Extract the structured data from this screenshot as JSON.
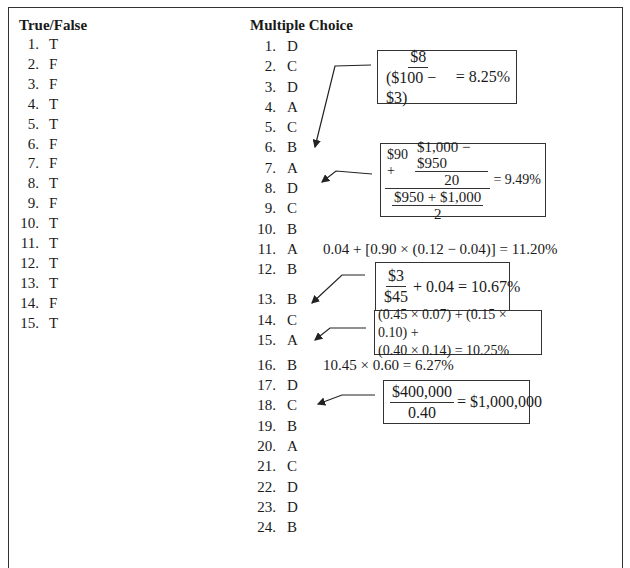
{
  "true_false": {
    "title": "True/False",
    "items": [
      {
        "num": "1.",
        "answer": "T"
      },
      {
        "num": "2.",
        "answer": "F"
      },
      {
        "num": "3.",
        "answer": "F"
      },
      {
        "num": "4.",
        "answer": "T"
      },
      {
        "num": "5.",
        "answer": "T"
      },
      {
        "num": "6.",
        "answer": "F"
      },
      {
        "num": "7.",
        "answer": "F"
      },
      {
        "num": "8.",
        "answer": "T"
      },
      {
        "num": "9.",
        "answer": "F"
      },
      {
        "num": "10.",
        "answer": "T"
      },
      {
        "num": "11.",
        "answer": "T"
      },
      {
        "num": "12.",
        "answer": "T"
      },
      {
        "num": "13.",
        "answer": "T"
      },
      {
        "num": "14.",
        "answer": "F"
      },
      {
        "num": "15.",
        "answer": "T"
      }
    ]
  },
  "multiple_choice": {
    "title": "Multiple Choice",
    "items": [
      {
        "num": "1.",
        "answer": "D"
      },
      {
        "num": "2.",
        "answer": "C"
      },
      {
        "num": "3.",
        "answer": "D"
      },
      {
        "num": "4.",
        "answer": "A"
      },
      {
        "num": "5.",
        "answer": "C"
      },
      {
        "num": "6.",
        "answer": "B"
      },
      {
        "num": "7.",
        "answer": "A"
      },
      {
        "num": "8.",
        "answer": "D"
      },
      {
        "num": "9.",
        "answer": "C"
      },
      {
        "num": "10.",
        "answer": "B"
      },
      {
        "num": "11.",
        "answer": "A"
      },
      {
        "num": "12.",
        "answer": "B"
      },
      {
        "num": "13.",
        "answer": "B"
      },
      {
        "num": "14.",
        "answer": "C"
      },
      {
        "num": "15.",
        "answer": "A"
      },
      {
        "num": "16.",
        "answer": "B"
      },
      {
        "num": "17.",
        "answer": "D"
      },
      {
        "num": "18.",
        "answer": "C"
      },
      {
        "num": "19.",
        "answer": "B"
      },
      {
        "num": "20.",
        "answer": "A"
      },
      {
        "num": "21.",
        "answer": "C"
      },
      {
        "num": "22.",
        "answer": "D"
      },
      {
        "num": "23.",
        "answer": "D"
      },
      {
        "num": "24.",
        "answer": "B"
      }
    ]
  },
  "calculations": {
    "q6": {
      "numerator": "$8",
      "denominator": "($100 − $3)",
      "result": "= 8.25%"
    },
    "q7": {
      "top_prefix": "$90 +",
      "top_frac_num": "$1,000 − $950",
      "top_frac_den": "20",
      "bottom_frac_num": "$950 + $1,000",
      "bottom_frac_den": "2",
      "result": "= 9.49%"
    },
    "q11": "0.04 + [0.90 × (0.12 − 0.04)] = 11.20%",
    "q13": {
      "numerator": "$3",
      "denominator": "$45",
      "result": "+ 0.04 = 10.67%"
    },
    "q15": {
      "line1": "(0.45 × 0.07) + (0.15 × 0.10) +",
      "line2": "(0.40 × 0.14) = 10.25%"
    },
    "q16": "10.45 × 0.60 = 6.27%",
    "q18": {
      "numerator": "$400,000",
      "denominator": "0.40",
      "result": "= $1,000,000"
    }
  }
}
